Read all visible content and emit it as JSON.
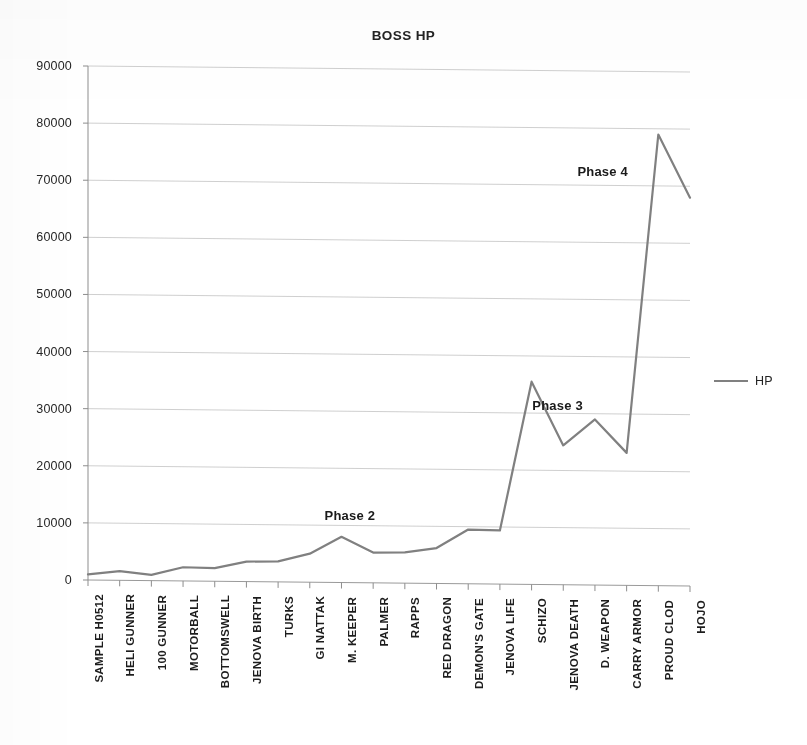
{
  "chart_data": {
    "type": "line",
    "title": "BOSS HP",
    "xlabel": "",
    "ylabel": "",
    "ylim": [
      0,
      90000
    ],
    "yticks": [
      0,
      10000,
      20000,
      30000,
      40000,
      50000,
      60000,
      70000,
      80000,
      90000
    ],
    "ytick_labels": [
      "0",
      "10000",
      "20000",
      "30000",
      "40000",
      "50000",
      "60000",
      "70000",
      "80000",
      "90000"
    ],
    "grid": true,
    "grid_axis": "y",
    "legend_position": "right",
    "legend": [
      "HP"
    ],
    "line_color": "#808080",
    "categories": [
      "SAMPLE H0512",
      "HELI GUNNER",
      "100 GUNNER",
      "MOTORBALL",
      "BOTTOMSWELL",
      "JENOVA BIRTH",
      "TURKS",
      "GI NATTAK",
      "M. KEEPER",
      "PALMER",
      "RAPPS",
      "RED DRAGON",
      "DEMON'S GATE",
      "JENOVA LIFE",
      "SCHIZO",
      "JENOVA DEATH",
      "D. WEAPON",
      "CARRY ARMOR",
      "PROUD CLOD",
      "HOJO"
    ],
    "series": [
      {
        "name": "HP",
        "values": [
          1000,
          1600,
          1000,
          2400,
          2300,
          3500,
          3600,
          5000,
          8000,
          5300,
          5400,
          6200,
          9500,
          9400,
          35500,
          24400,
          29000,
          23200,
          79000,
          68000
        ]
      }
    ],
    "annotations": [
      {
        "text": "Phase 2",
        "x_pct": 43.5,
        "y_value": 11800
      },
      {
        "text": "Phase 3",
        "x_pct": 78.0,
        "y_value": 31400
      },
      {
        "text": "Phase 4",
        "x_pct": 85.5,
        "y_value": 72600
      }
    ]
  }
}
